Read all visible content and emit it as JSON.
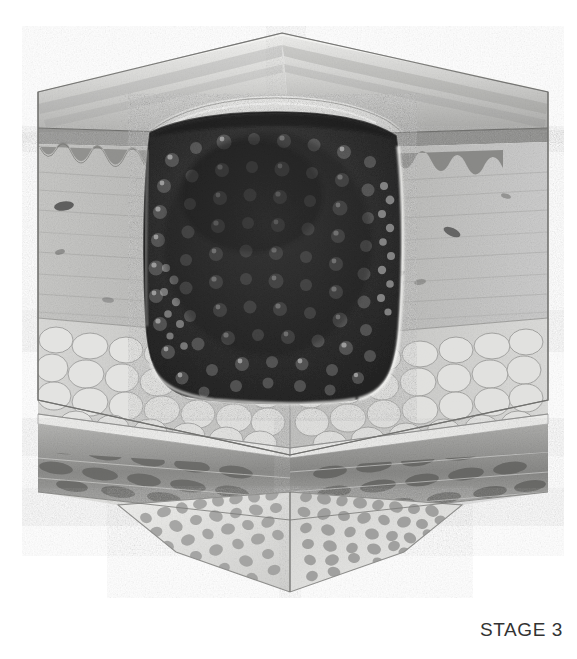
{
  "figure": {
    "caption": "STAGE 3",
    "caption_color": "#333333",
    "background_color": "#ffffff",
    "view": "three-dimensional-block-cutaway",
    "medium": "grayscale-stipple-illustration"
  },
  "palette": {
    "skin_surface_light": "#e2e2e0",
    "skin_surface_mid": "#c4c4c2",
    "skin_surface_shadow": "#a6a6a4",
    "epidermis_band": "#8f8f8d",
    "dermis_light": "#cfcfcd",
    "dermis_mid": "#b4b4b2",
    "dermis_shadow": "#969694",
    "fat_light": "#dcdcda",
    "fat_mid": "#c2c2c0",
    "fat_outline": "#8c8c8a",
    "muscle_light": "#b8b8b6",
    "muscle_dark": "#6f6f6d",
    "fascia_pale": "#e6e6e4",
    "bone_light": "#ececea",
    "bone_trabecula": "#9a9a98",
    "wound_dark": "#2b2b2b",
    "wound_mid": "#3e3e3e",
    "wound_highlight": "#9d9d9d",
    "edge_line": "#6b6b69",
    "rim_highlight": "#f2f2f0"
  },
  "layers": [
    {
      "id": "epidermis",
      "name": "Epidermis",
      "order": 1,
      "depth_band": "0-8%",
      "tone": "#8f8f8d"
    },
    {
      "id": "dermis",
      "name": "Dermis",
      "order": 2,
      "depth_band": "8-48%",
      "tone": "#b4b4b2"
    },
    {
      "id": "subcutaneous",
      "name": "Subcutaneous fat",
      "order": 3,
      "depth_band": "48-70%",
      "tone": "#c8c8c6"
    },
    {
      "id": "fascia",
      "name": "Deep fascia",
      "order": 4,
      "depth_band": "70-73%",
      "tone": "#e6e6e4"
    },
    {
      "id": "muscle",
      "name": "Muscle",
      "order": 5,
      "depth_band": "73-82%",
      "tone": "#8a8a88"
    },
    {
      "id": "bone",
      "name": "Bone (cancellous)",
      "order": 6,
      "depth_band": "82-100%",
      "tone": "#d8d8d6"
    }
  ],
  "wound": {
    "id": "stage-3-ulcer",
    "name": "Full-thickness ulcer crater",
    "depth_reaches_layer": "subcutaneous",
    "bone_exposed": false,
    "muscle_exposed": false,
    "edges": "rolled-undermined",
    "base_texture": "granulation-nodules",
    "fill_tone": "#2b2b2b",
    "nodule_tone": "#9d9d9d"
  },
  "geometry": {
    "block_top_apex": {
      "x": 282,
      "y": 33
    },
    "block_top_left": {
      "x": 38,
      "y": 92
    },
    "block_top_right": {
      "x": 548,
      "y": 92
    },
    "block_left_edge_x": 38,
    "block_right_edge_x": 548,
    "front_vertical_center_x": 290,
    "corner_front_y": 455,
    "bone_apex": {
      "x": 290,
      "y": 592
    },
    "bone_left": {
      "x": 118,
      "y": 505
    },
    "bone_right": {
      "x": 462,
      "y": 505
    },
    "wound_left_x": 138,
    "wound_right_x": 400,
    "wound_top_y": 120,
    "wound_bottom_y": 402
  },
  "textures": {
    "granulation_nodule_count": 150,
    "fat_lobule_count": 58,
    "muscle_fascicle_count": 34,
    "trabecula_count": 190,
    "rete_ridge_count": 14,
    "vessel_profile_count": 8,
    "stipple_density": "fine"
  }
}
